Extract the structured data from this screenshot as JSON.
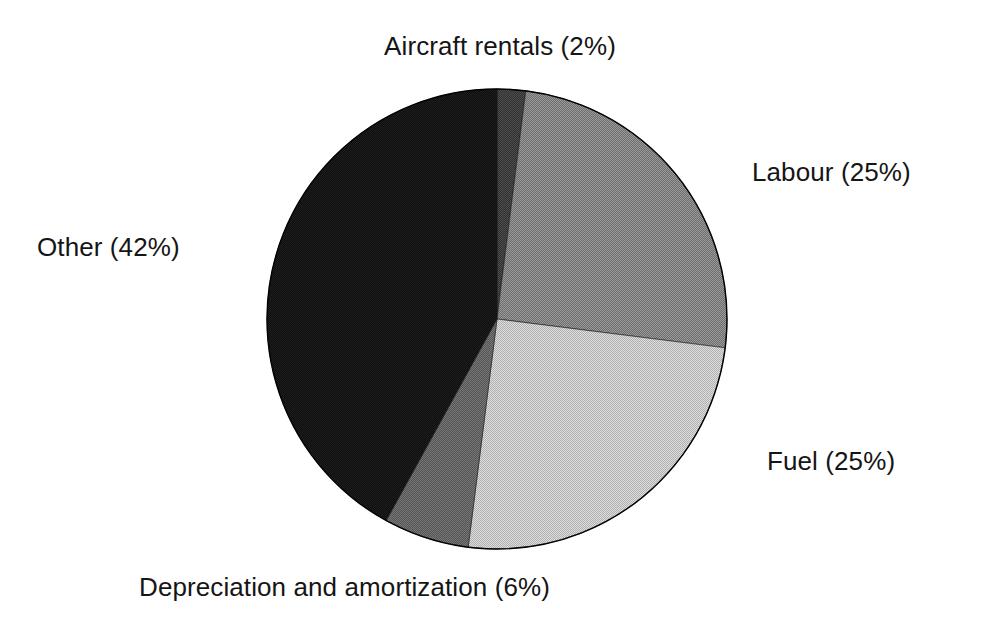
{
  "chart_data": {
    "type": "pie",
    "title": "",
    "subtitle": "",
    "xlabel": "",
    "ylabel": "",
    "legend_position": "none",
    "grid": false,
    "label_format": "name (percent%)",
    "start_angle_deg": 0,
    "direction": "clockwise",
    "categories": [
      "Aircraft rentals",
      "Labour",
      "Fuel",
      "Depreciation and amortization",
      "Other"
    ],
    "values": [
      2,
      25,
      25,
      6,
      42
    ],
    "units": "percent",
    "total": 100,
    "slices": [
      {
        "name": "Aircraft rentals",
        "value": 2,
        "percent_text": "2%",
        "label": "Aircraft rentals (2%)",
        "color": "#3c3c3c",
        "start_deg": 0,
        "end_deg": 7.2
      },
      {
        "name": "Labour",
        "value": 25,
        "percent_text": "25%",
        "label": "Labour (25%)",
        "color": "#7e7e7e",
        "start_deg": 7.2,
        "end_deg": 97.2
      },
      {
        "name": "Fuel",
        "value": 25,
        "percent_text": "25%",
        "label": "Fuel (25%)",
        "color": "#c9c9c9",
        "start_deg": 97.2,
        "end_deg": 187.2
      },
      {
        "name": "Depreciation and amortization",
        "value": 6,
        "percent_text": "6%",
        "label": "Depreciation and amortization (6%)",
        "color": "#606060",
        "start_deg": 187.2,
        "end_deg": 208.8
      },
      {
        "name": "Other",
        "value": 42,
        "percent_text": "42%",
        "label": "Other (42%)",
        "color": "#141414",
        "start_deg": 208.8,
        "end_deg": 360
      }
    ],
    "geometry": {
      "center_x": 231,
      "center_y": 231,
      "radius": 230,
      "outline_color": "#000000"
    }
  },
  "labels": {
    "aircraft_rentals": "Aircraft rentals (2%)",
    "labour": "Labour (25%)",
    "fuel": "Fuel (25%)",
    "depreciation": "Depreciation and amortization (6%)",
    "other": "Other (42%)"
  },
  "colors": {
    "background": "#ffffff",
    "text": "#151515",
    "aircraft_rentals": "#3c3c3c",
    "labour": "#7e7e7e",
    "fuel": "#c9c9c9",
    "depreciation": "#606060",
    "other": "#141414"
  }
}
